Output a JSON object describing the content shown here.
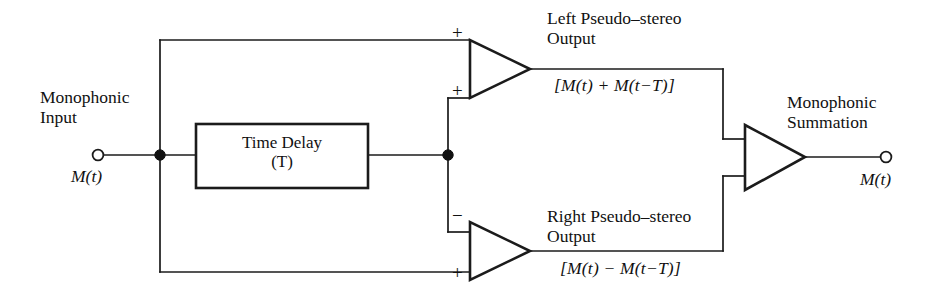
{
  "diagram": {
    "colors": {
      "line": "#1b1b1b",
      "background": "#ffffff",
      "text": "#111111"
    },
    "input": {
      "label_line1": "Monophonic",
      "label_line2": "Input",
      "signal": "M(t)",
      "terminal": "open-circle"
    },
    "delay_block": {
      "label": "Time Delay",
      "parameter": "(T)"
    },
    "left_amp": {
      "input_top_sign": "+",
      "input_bottom_sign": "+",
      "output_label_line1": "Left Pseudo–stereo",
      "output_label_line2": "Output",
      "equation": "[M(t) + M(t−T)]"
    },
    "right_amp": {
      "input_top_sign": "−",
      "input_bottom_sign": "+",
      "output_label_line1": "Right Pseudo–stereo",
      "output_label_line2": "Output",
      "equation": "[M(t) − M(t−T)]"
    },
    "summation_amp": {
      "label_line1": "Monophonic",
      "label_line2": "Summation",
      "output_signal": "M(t)",
      "terminal": "open-circle"
    }
  }
}
